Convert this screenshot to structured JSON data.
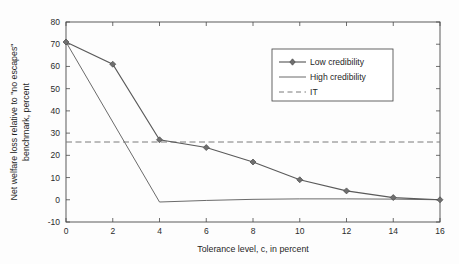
{
  "chart_data": {
    "type": "line",
    "title": "",
    "xlabel": "Tolerance level, c, in percent",
    "ylabel": "Net welfare loss relative to \"no escapes\" benchmark, percent",
    "ylabel_line1": "Net welfare loss relative to \"no escapes\"",
    "ylabel_line2": "benchmark, percent",
    "xlim": [
      0,
      16
    ],
    "ylim": [
      -10,
      80
    ],
    "xticks": [
      0,
      2,
      4,
      6,
      8,
      10,
      12,
      14,
      16
    ],
    "yticks": [
      -10,
      0,
      10,
      20,
      30,
      40,
      50,
      60,
      70,
      80
    ],
    "xtick_labels": [
      "0",
      "2",
      "4",
      "6",
      "8",
      "10",
      "12",
      "14",
      "16"
    ],
    "ytick_labels": [
      "-10",
      "0",
      "10",
      "20",
      "30",
      "40",
      "50",
      "60",
      "70",
      "80"
    ],
    "grid": false,
    "legend_position": "upper right",
    "series": [
      {
        "name": "Low credibility",
        "style": "solid-with-diamond-markers",
        "color": "#5a5a5a",
        "x": [
          0,
          2,
          4,
          6,
          8,
          10,
          12,
          14,
          16
        ],
        "values": [
          71,
          61,
          27,
          23.5,
          17,
          9,
          4,
          1,
          0
        ]
      },
      {
        "name": "High credibility",
        "style": "solid",
        "color": "#6b6b6b",
        "x": [
          0,
          2,
          4,
          6,
          8,
          10,
          12,
          14,
          16
        ],
        "values": [
          71,
          35,
          -1,
          -0.3,
          0.2,
          0.4,
          0.4,
          0.3,
          0
        ]
      },
      {
        "name": "IT",
        "style": "dashed-horizontal",
        "color": "#7a7a7a",
        "x": [
          0,
          16
        ],
        "values": [
          26,
          26
        ]
      }
    ],
    "legend_entries": [
      {
        "label": "Low credibility",
        "style": "line-marker"
      },
      {
        "label": "High credibility",
        "style": "line"
      },
      {
        "label": "IT",
        "style": "dashed"
      }
    ]
  }
}
